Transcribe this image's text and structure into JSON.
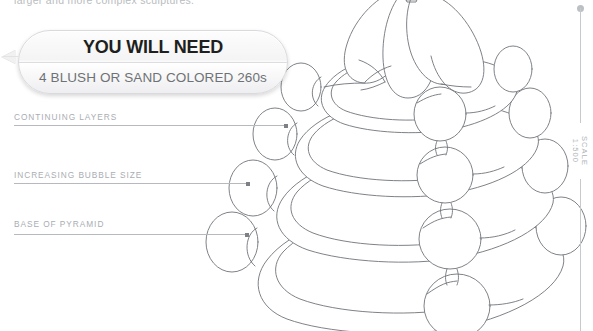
{
  "page": {
    "intro_text": "larger and more complex sculptures.",
    "background_color": "#ffffff"
  },
  "callout": {
    "title": "YOU WILL NEED",
    "subtitle": "4 BLUSH OR SAND COLORED 260s",
    "title_color": "#201f1e",
    "subtitle_color": "#6e7276",
    "border_color": "#d9dadd"
  },
  "annotations": [
    {
      "label": "CONTINUING LAYERS",
      "leader_color": "#b6babf",
      "dot_color": "#7d8186"
    },
    {
      "label": "INCREASING BUBBLE SIZE",
      "leader_color": "#b6babf",
      "dot_color": "#7d8186"
    },
    {
      "label": "BASE OF PYRAMID",
      "leader_color": "#b6babf",
      "dot_color": "#7d8186"
    }
  ],
  "scale": {
    "text": "SCALE 1:500",
    "line_color": "#c7cacd",
    "dot_color": "#bcc0c4"
  },
  "drawing": {
    "name": "balloon-pyramid-line-drawing",
    "stroke_color": "#6f7479",
    "fill_color": "#ffffff",
    "layers": 4,
    "description": "Stacked balloon pyramid: four tiers of looped 260 balloons with corner knot bubbles and a twisted apex."
  }
}
